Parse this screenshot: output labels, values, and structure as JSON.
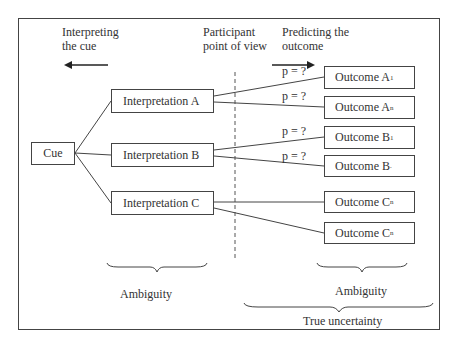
{
  "headers": {
    "interpreting": [
      "Interpreting",
      "the cue"
    ],
    "participant": [
      "Participant",
      "point of view"
    ],
    "predicting": [
      "Predicting the",
      "outcome"
    ]
  },
  "cue": {
    "label": "Cue"
  },
  "interpretations": [
    {
      "label": "Interpretation A"
    },
    {
      "label": "Interpretation B"
    },
    {
      "label": "Interpretation C"
    }
  ],
  "outcomes": [
    {
      "label": "Outcome A",
      "sub": "1"
    },
    {
      "label": "Outcome A",
      "sub": "n"
    },
    {
      "label": "Outcome B",
      "sub": "1"
    },
    {
      "label": "Outcome B",
      "sub": "."
    },
    {
      "label": "Outcome C",
      "sub": "n"
    },
    {
      "label": "Outcome C",
      "sub": "n"
    }
  ],
  "probabilities": [
    "p = ?",
    "p = ?",
    "p = ?",
    "p = ?"
  ],
  "braces": {
    "left_label": "Ambiguity",
    "right_label": "Ambiguity",
    "bottom_label": "True uncertainty"
  },
  "colors": {
    "line": "#444444",
    "text": "#333333",
    "background": "#ffffff"
  }
}
